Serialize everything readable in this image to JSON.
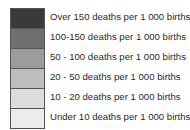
{
  "chart_data": {
    "type": "legend",
    "title": "",
    "entries": [
      {
        "label": "Over 150 deaths per 1 000 births",
        "color": "#3a3a3a"
      },
      {
        "label": "100-150 deaths per 1 000 births",
        "color": "#6f6f6f"
      },
      {
        "label": "50-100 deaths per 1 000 births",
        "color": "#9b9b9b"
      },
      {
        "label": "20-50 deaths per 1 000 births",
        "color": "#bdbdbd"
      },
      {
        "label": "10-20 deaths per 1 000 births",
        "color": "#dcdcdc"
      },
      {
        "label": "Under 10 deaths per 1 000 births",
        "color": "#ececec"
      }
    ]
  },
  "legend": {
    "items": [
      {
        "label": "Over 150 deaths per 1 000 births",
        "color": "#3a3a3a"
      },
      {
        "label": "100-150 deaths per 1 000 births",
        "color": "#6f6f6f"
      },
      {
        "label": "50 - 100 deaths per 1 000 births",
        "color": "#9b9b9b"
      },
      {
        "label": "20 - 50 deaths per 1 000 births",
        "color": "#bdbdbd"
      },
      {
        "label": "10 - 20 deaths per 1 000 births",
        "color": "#dcdcdc"
      },
      {
        "label": "Under 10 deaths per 1 000 births",
        "color": "#ececec"
      }
    ]
  }
}
